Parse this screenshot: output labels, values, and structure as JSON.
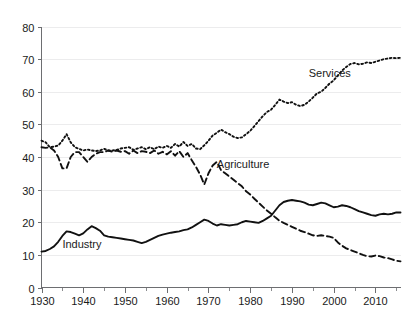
{
  "chart_data": {
    "type": "line",
    "title": "",
    "subtitle": "",
    "xlabel": "",
    "ylabel": "",
    "xlim": [
      1930,
      2016
    ],
    "ylim": [
      0,
      80
    ],
    "grid": true,
    "legend_position": "inline-annotations",
    "y_ticks": [
      0,
      10,
      20,
      30,
      40,
      50,
      60,
      70,
      80
    ],
    "y_tick_labels": [
      "0",
      "10",
      "20",
      "30",
      "40",
      "50",
      "60",
      "70",
      "80"
    ],
    "x_ticks": [
      1930,
      1940,
      1950,
      1960,
      1970,
      1980,
      1990,
      2000,
      2010
    ],
    "x_tick_labels": [
      "1930",
      "1940",
      "1950",
      "1960",
      "1970",
      "1980",
      "1990",
      "2000",
      "2010"
    ],
    "x_minor_ticks": [
      1935,
      1945,
      1955,
      1965,
      1975,
      1985,
      1995,
      2005,
      2015
    ],
    "annotations": [
      {
        "text": "Services",
        "x": 1994,
        "y": 64.5
      },
      {
        "text": "Agriculture",
        "x": 1972,
        "y": 36.5
      },
      {
        "text": "Industry",
        "x": 1935,
        "y": 12.0
      }
    ],
    "x": [
      1930,
      1931,
      1932,
      1933,
      1934,
      1935,
      1936,
      1937,
      1938,
      1939,
      1940,
      1941,
      1942,
      1943,
      1944,
      1945,
      1946,
      1947,
      1948,
      1949,
      1950,
      1951,
      1952,
      1953,
      1954,
      1955,
      1956,
      1957,
      1958,
      1959,
      1960,
      1961,
      1962,
      1963,
      1964,
      1965,
      1966,
      1967,
      1968,
      1969,
      1970,
      1971,
      1972,
      1973,
      1974,
      1975,
      1976,
      1977,
      1978,
      1979,
      1980,
      1981,
      1982,
      1983,
      1984,
      1985,
      1986,
      1987,
      1988,
      1989,
      1990,
      1991,
      1992,
      1993,
      1994,
      1995,
      1996,
      1997,
      1998,
      1999,
      2000,
      2001,
      2002,
      2003,
      2004,
      2005,
      2006,
      2007,
      2008,
      2009,
      2010,
      2011,
      2012,
      2013,
      2014,
      2015,
      2016
    ],
    "series": [
      {
        "name": "Services",
        "style": "dotted",
        "color": "#111111",
        "values": [
          45.0,
          44.5,
          43.0,
          43.2,
          43.5,
          45.0,
          47.0,
          44.5,
          43.0,
          42.5,
          42.0,
          42.3,
          42.0,
          41.8,
          42.0,
          42.5,
          42.0,
          42.0,
          42.2,
          42.6,
          42.8,
          43.0,
          42.2,
          42.6,
          43.0,
          42.4,
          43.0,
          42.4,
          43.2,
          42.8,
          43.4,
          42.8,
          44.0,
          43.2,
          44.6,
          43.4,
          44.0,
          42.6,
          42.4,
          43.6,
          45.0,
          46.6,
          47.4,
          48.4,
          47.6,
          47.0,
          46.2,
          45.8,
          46.0,
          47.0,
          48.0,
          49.5,
          51.0,
          52.5,
          53.8,
          54.5,
          56.0,
          57.6,
          57.0,
          56.5,
          56.8,
          56.0,
          55.6,
          56.0,
          57.0,
          58.2,
          59.5,
          60.0,
          61.2,
          62.5,
          63.5,
          65.0,
          66.5,
          67.6,
          68.5,
          68.8,
          68.4,
          68.6,
          69.0,
          68.8,
          69.2,
          69.6,
          70.0,
          70.2,
          70.4,
          70.3,
          70.4
        ]
      },
      {
        "name": "Agriculture",
        "style": "dashed",
        "color": "#111111",
        "values": [
          43.0,
          42.8,
          43.0,
          42.0,
          40.0,
          36.5,
          36.5,
          40.0,
          41.5,
          41.5,
          40.0,
          38.5,
          40.0,
          41.0,
          41.5,
          41.5,
          42.0,
          41.6,
          42.0,
          41.6,
          41.8,
          41.0,
          42.0,
          41.2,
          41.8,
          41.6,
          41.2,
          42.0,
          41.0,
          41.6,
          40.8,
          41.8,
          40.4,
          41.8,
          40.0,
          41.2,
          39.0,
          37.0,
          34.6,
          31.6,
          35.0,
          37.4,
          38.5,
          36.0,
          35.0,
          34.0,
          33.0,
          32.0,
          31.0,
          29.5,
          28.5,
          27.2,
          26.0,
          24.8,
          23.6,
          22.6,
          21.5,
          20.5,
          19.8,
          19.2,
          18.6,
          18.0,
          17.4,
          17.0,
          16.5,
          16.0,
          15.8,
          16.0,
          15.8,
          15.6,
          15.2,
          13.8,
          12.8,
          12.0,
          11.5,
          11.0,
          10.5,
          10.0,
          9.6,
          9.5,
          9.8,
          9.6,
          9.2,
          9.0,
          8.6,
          8.2,
          8.0
        ]
      },
      {
        "name": "Industry",
        "style": "solid",
        "color": "#111111",
        "values": [
          11.0,
          11.2,
          11.8,
          12.6,
          14.0,
          15.8,
          17.2,
          17.0,
          16.5,
          16.0,
          16.6,
          17.8,
          18.8,
          18.2,
          17.4,
          16.0,
          15.6,
          15.4,
          15.2,
          15.0,
          14.8,
          14.6,
          14.4,
          14.0,
          13.6,
          14.0,
          14.6,
          15.2,
          15.8,
          16.2,
          16.5,
          16.8,
          17.0,
          17.2,
          17.6,
          17.8,
          18.4,
          19.2,
          20.0,
          20.8,
          20.4,
          19.6,
          19.0,
          19.4,
          19.2,
          19.0,
          19.2,
          19.4,
          20.0,
          20.4,
          20.2,
          20.0,
          19.8,
          20.4,
          21.2,
          22.0,
          23.6,
          25.2,
          26.2,
          26.6,
          26.8,
          26.6,
          26.4,
          26.0,
          25.4,
          25.2,
          25.6,
          26.0,
          25.8,
          25.2,
          24.6,
          24.8,
          25.2,
          25.0,
          24.6,
          24.0,
          23.4,
          23.0,
          22.6,
          22.2,
          22.0,
          22.4,
          22.6,
          22.4,
          22.6,
          23.0,
          23.0
        ]
      }
    ]
  }
}
